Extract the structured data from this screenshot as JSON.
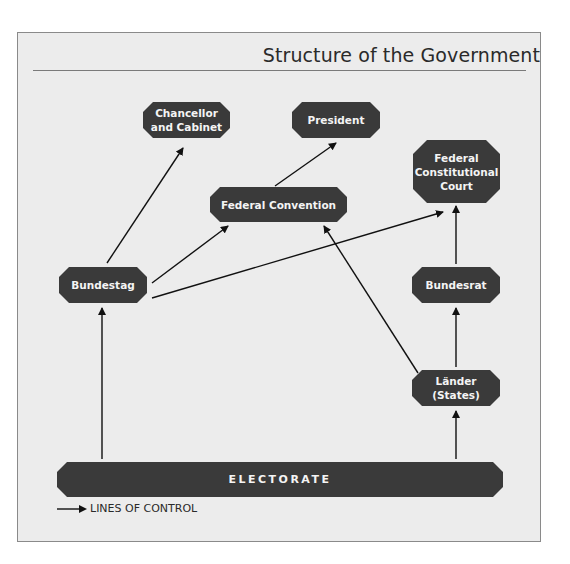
{
  "title": "Structure of the Government",
  "nodes": {
    "chancellor": "Chancellor\nand Cabinet",
    "chancellor_line1": "Chancellor",
    "chancellor_line2": "and Cabinet",
    "president": "President",
    "federal_convention": "Federal Convention",
    "constitutional_court_line1": "Federal",
    "constitutional_court_line2": "Constitutional",
    "constitutional_court_line3": "Court",
    "bundestag": "Bundestag",
    "bundesrat": "Bundesrat",
    "laender_line1": "Länder",
    "laender_line2": "(States)",
    "electorate": "ELECTORATE"
  },
  "edges": [
    {
      "from": "Bundestag",
      "to": "Chancellor and Cabinet"
    },
    {
      "from": "Bundestag",
      "to": "Federal Convention"
    },
    {
      "from": "Bundestag",
      "to": "Federal Constitutional Court"
    },
    {
      "from": "Federal Convention",
      "to": "President"
    },
    {
      "from": "Länder (States)",
      "to": "Federal Convention"
    },
    {
      "from": "Länder (States)",
      "to": "Bundesrat"
    },
    {
      "from": "Bundesrat",
      "to": "Federal Constitutional Court"
    },
    {
      "from": "Electorate",
      "to": "Bundestag"
    },
    {
      "from": "Electorate",
      "to": "Länder (States)"
    }
  ],
  "legend": {
    "label": "LINES OF CONTROL"
  },
  "colors": {
    "node_fill": "#3a3a3a",
    "node_text": "#f4f4f4",
    "background": "#ececec",
    "line": "#111111"
  }
}
